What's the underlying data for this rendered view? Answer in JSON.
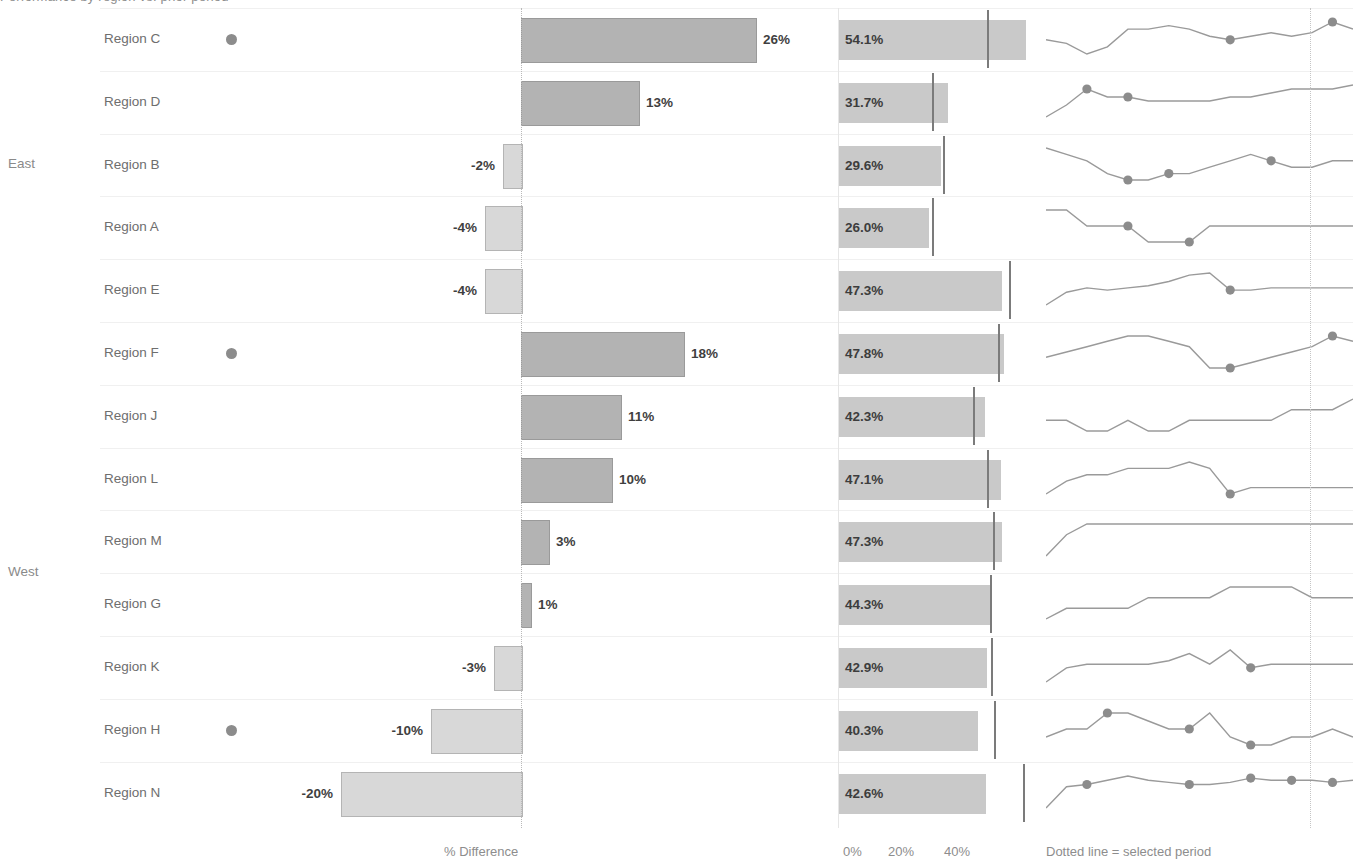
{
  "title_sliver": "Performance by region vs. prior period",
  "groups": [
    {
      "label": "East",
      "center_row": 2
    },
    {
      "label": "West",
      "center_row": 9
    }
  ],
  "footers": {
    "pct_difference": "% Difference",
    "axis_0": "0%",
    "axis_20": "20%",
    "axis_40": "40%",
    "dotted_note": "Dotted line =  selected period"
  },
  "colors": {
    "bar_positive": "#b3b3b3",
    "bar_negative": "#d8d8d8",
    "bullet_bar": "#c9c9c9",
    "reference_marker": "#7b7b7b",
    "sparkline": "#9a9a9a",
    "marker_dot": "#8c8c8c",
    "gridline": "#f0f0f0",
    "text": "#6e6e6e"
  },
  "chart_data": {
    "type": "bar",
    "title": "Performance by region vs. prior period",
    "xlabel": "% Difference",
    "ylabel": "",
    "grid": true,
    "legend": "Dotted line =  selected period",
    "panels": [
      {
        "name": "pct-difference",
        "type": "bar",
        "orientation": "horizontal",
        "axis_label": "% Difference",
        "zero_line": true,
        "xlim": [
          -22,
          30
        ]
      },
      {
        "name": "rate-bullet",
        "type": "bar",
        "orientation": "horizontal",
        "ticks": [
          "0%",
          "20%",
          "40%"
        ],
        "tick_values": [
          0,
          20,
          40
        ],
        "xlim": [
          0,
          56
        ],
        "reference_marker": "prior period value"
      },
      {
        "name": "trend-sparkline",
        "type": "line",
        "note": "Dotted line =  selected period"
      }
    ],
    "categories": [
      "Region C",
      "Region D",
      "Region B",
      "Region A",
      "Region E",
      "Region F",
      "Region J",
      "Region L",
      "Region M",
      "Region G",
      "Region K",
      "Region H",
      "Region N"
    ],
    "series": [
      {
        "name": "% Difference",
        "values": [
          26,
          13,
          -2,
          -4,
          -4,
          18,
          11,
          10,
          3,
          1,
          -3,
          -10,
          -20
        ]
      },
      {
        "name": "Rate",
        "values": [
          54.1,
          31.7,
          29.6,
          26.0,
          47.3,
          47.8,
          42.3,
          47.1,
          47.3,
          44.3,
          42.9,
          40.3,
          42.6
        ]
      },
      {
        "name": "Prior period reference",
        "values": [
          43.0,
          27.1,
          30.2,
          27.0,
          49.2,
          46.1,
          38.7,
          42.8,
          44.7,
          43.8,
          44.2,
          44.8,
          53.2
        ]
      }
    ],
    "rows": [
      {
        "group": "East",
        "region": "Region C",
        "highlight_dot": true,
        "diff_value": 26,
        "diff_label": "26%",
        "rate_value": 54.1,
        "rate_label": "54.1%",
        "reference_value": 43.0,
        "spark": [
          32,
          31,
          28,
          30,
          35,
          35,
          36,
          35,
          33,
          32,
          33,
          34,
          33,
          34,
          37,
          35
        ],
        "spark_markers": [
          9,
          14
        ]
      },
      {
        "group": "East",
        "region": "Region D",
        "highlight_dot": false,
        "diff_value": 13,
        "diff_label": "13%",
        "rate_value": 31.7,
        "rate_label": "31.7%",
        "reference_value": 27.1,
        "spark": [
          28,
          31,
          35,
          33,
          33,
          32,
          32,
          32,
          32,
          33,
          33,
          34,
          35,
          35,
          35,
          36
        ],
        "spark_markers": [
          2,
          4
        ]
      },
      {
        "group": "East",
        "region": "Region B",
        "highlight_dot": false,
        "diff_value": -2,
        "diff_label": "-2%",
        "rate_value": 29.6,
        "rate_label": "29.6%",
        "reference_value": 30.2,
        "spark": [
          35,
          34,
          33,
          31,
          30,
          30,
          31,
          31,
          32,
          33,
          34,
          33,
          32,
          32,
          33,
          33
        ],
        "spark_markers": [
          4,
          6,
          11
        ]
      },
      {
        "group": "East",
        "region": "Region A",
        "highlight_dot": false,
        "diff_value": -4,
        "diff_label": "-4%",
        "rate_value": 26.0,
        "rate_label": "26.0%",
        "reference_value": 27.0,
        "spark": [
          33,
          33,
          32,
          32,
          32,
          31,
          31,
          31,
          32,
          32,
          32,
          32,
          32,
          32,
          32,
          32
        ],
        "spark_markers": [
          4,
          7
        ]
      },
      {
        "group": "East",
        "region": "Region E",
        "highlight_dot": false,
        "diff_value": -4,
        "diff_label": "-4%",
        "rate_value": 47.3,
        "rate_label": "47.3%",
        "reference_value": 49.2,
        "spark": [
          24,
          30,
          32,
          31,
          32,
          33,
          35,
          38,
          39,
          31,
          31,
          32,
          32,
          32,
          32,
          32
        ],
        "spark_markers": [
          9
        ]
      },
      {
        "group": "West",
        "region": "Region F",
        "highlight_dot": true,
        "diff_value": 18,
        "diff_label": "18%",
        "rate_value": 47.8,
        "rate_label": "47.8%",
        "reference_value": 46.1,
        "spark": [
          32,
          33,
          34,
          35,
          36,
          36,
          35,
          34,
          30,
          30,
          31,
          32,
          33,
          34,
          36,
          35
        ],
        "spark_markers": [
          9,
          14
        ]
      },
      {
        "group": "West",
        "region": "Region J",
        "highlight_dot": false,
        "diff_value": 11,
        "diff_label": "11%",
        "rate_value": 42.3,
        "rate_label": "42.3%",
        "reference_value": 38.7,
        "spark": [
          33,
          33,
          32,
          32,
          33,
          32,
          32,
          33,
          33,
          33,
          33,
          33,
          34,
          34,
          34,
          35
        ],
        "spark_markers": []
      },
      {
        "group": "West",
        "region": "Region L",
        "highlight_dot": false,
        "diff_value": 10,
        "diff_label": "10%",
        "rate_value": 47.1,
        "rate_label": "47.1%",
        "reference_value": 42.8,
        "spark": [
          31,
          33,
          34,
          34,
          35,
          35,
          35,
          36,
          35,
          31,
          32,
          32,
          32,
          32,
          32,
          32
        ],
        "spark_markers": [
          9
        ]
      },
      {
        "group": "West",
        "region": "Region M",
        "highlight_dot": false,
        "diff_value": 3,
        "diff_label": "3%",
        "rate_value": 47.3,
        "rate_label": "47.3%",
        "reference_value": 44.7,
        "spark": [
          28,
          32,
          34,
          34,
          34,
          34,
          34,
          34,
          34,
          34,
          34,
          34,
          34,
          34,
          34,
          34
        ],
        "spark_markers": []
      },
      {
        "group": "West",
        "region": "Region G",
        "highlight_dot": false,
        "diff_value": 1,
        "diff_label": "1%",
        "rate_value": 44.3,
        "rate_label": "44.3%",
        "reference_value": 43.8,
        "spark": [
          32,
          33,
          33,
          33,
          33,
          34,
          34,
          34,
          34,
          35,
          35,
          35,
          35,
          34,
          34,
          34
        ],
        "spark_markers": []
      },
      {
        "group": "West",
        "region": "Region K",
        "highlight_dot": false,
        "diff_value": -3,
        "diff_label": "-3%",
        "rate_value": 42.9,
        "rate_label": "42.9%",
        "reference_value": 44.2,
        "spark": [
          29,
          33,
          34,
          34,
          34,
          34,
          35,
          37,
          34,
          38,
          33,
          34,
          34,
          34,
          34,
          34
        ],
        "spark_markers": [
          10
        ]
      },
      {
        "group": "West",
        "region": "Region H",
        "highlight_dot": true,
        "diff_value": -10,
        "diff_label": "-10%",
        "rate_value": 40.3,
        "rate_label": "40.3%",
        "reference_value": 44.8,
        "spark": [
          33,
          34,
          34,
          36,
          36,
          35,
          34,
          34,
          36,
          33,
          32,
          32,
          33,
          33,
          34,
          33
        ],
        "spark_markers": [
          3,
          7,
          10
        ]
      },
      {
        "group": "West",
        "region": "Region N",
        "highlight_dot": false,
        "diff_value": -20,
        "diff_label": "-20%",
        "rate_value": 42.6,
        "rate_label": "42.6%",
        "reference_value": 53.2,
        "spark": [
          22,
          32,
          33,
          35,
          37,
          35,
          34,
          33,
          33,
          34,
          36,
          35,
          35,
          35,
          34,
          35
        ],
        "spark_markers": [
          2,
          7,
          10,
          12,
          14
        ]
      }
    ]
  }
}
